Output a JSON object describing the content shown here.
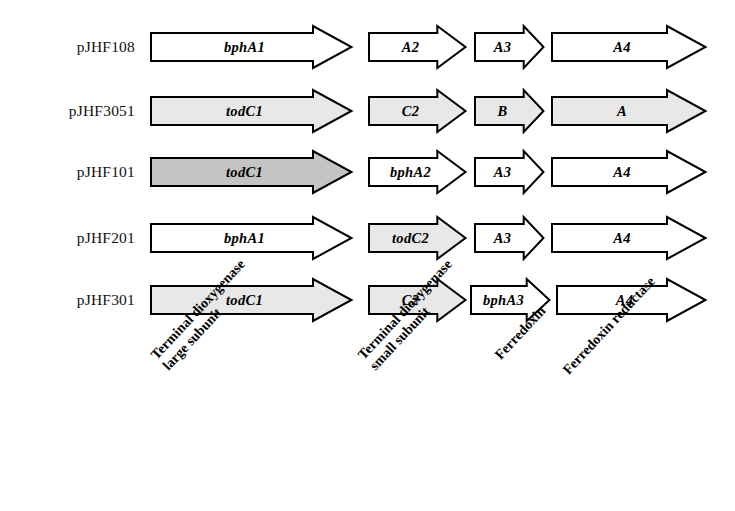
{
  "figure": {
    "type": "gene-construct-map",
    "background": "#ffffff",
    "outline_color": "#000000",
    "shading": {
      "none": "#ffffff",
      "light": "#e8e8e8",
      "dark": "#c4c4c4"
    }
  },
  "rows": [
    {
      "plasmid": "pJHF108",
      "y": 47,
      "genes": [
        {
          "label": "bphA1",
          "x": 150,
          "width": 203,
          "shade": "none"
        },
        {
          "label": "A2",
          "x": 368,
          "width": 99,
          "shade": "none"
        },
        {
          "label": "A3",
          "x": 474,
          "width": 71,
          "shade": "none"
        },
        {
          "label": "A4",
          "x": 551,
          "width": 156,
          "shade": "none"
        }
      ]
    },
    {
      "plasmid": "pJHF3051",
      "y": 111,
      "genes": [
        {
          "label": "todC1",
          "x": 150,
          "width": 203,
          "shade": "light"
        },
        {
          "label": "C2",
          "x": 368,
          "width": 99,
          "shade": "light"
        },
        {
          "label": "B",
          "x": 474,
          "width": 71,
          "shade": "light"
        },
        {
          "label": "A",
          "x": 551,
          "width": 156,
          "shade": "light"
        }
      ]
    },
    {
      "plasmid": "pJHF101",
      "y": 172,
      "genes": [
        {
          "label": "todC1",
          "x": 150,
          "width": 203,
          "shade": "dark"
        },
        {
          "label": "bphA2",
          "x": 368,
          "width": 99,
          "shade": "none"
        },
        {
          "label": "A3",
          "x": 474,
          "width": 71,
          "shade": "none"
        },
        {
          "label": "A4",
          "x": 551,
          "width": 156,
          "shade": "none"
        }
      ]
    },
    {
      "plasmid": "pJHF201",
      "y": 238,
      "genes": [
        {
          "label": "bphA1",
          "x": 150,
          "width": 203,
          "shade": "none"
        },
        {
          "label": "todC2",
          "x": 368,
          "width": 99,
          "shade": "light"
        },
        {
          "label": "A3",
          "x": 474,
          "width": 71,
          "shade": "none"
        },
        {
          "label": "A4",
          "x": 551,
          "width": 156,
          "shade": "none"
        }
      ]
    },
    {
      "plasmid": "pJHF301",
      "y": 300,
      "genes": [
        {
          "label": "todC1",
          "x": 150,
          "width": 203,
          "shade": "light"
        },
        {
          "label": "C2",
          "x": 368,
          "width": 99,
          "shade": "light"
        },
        {
          "label": "bphA3",
          "x": 470,
          "width": 81,
          "shade": "none"
        },
        {
          "label": "A4",
          "x": 556,
          "width": 151,
          "shade": "none"
        }
      ]
    }
  ],
  "category_labels": [
    {
      "lines": [
        "Terminal dioxygenase",
        "large subunit"
      ],
      "x": 148,
      "y": 352
    },
    {
      "lines": [
        "Terminal dioxygenase",
        "small subunit"
      ],
      "x": 355,
      "y": 352
    },
    {
      "lines": [
        "Ferredoxin"
      ],
      "x": 492,
      "y": 352
    },
    {
      "lines": [
        "Ferredoxin reductase"
      ],
      "x": 560,
      "y": 367
    }
  ]
}
